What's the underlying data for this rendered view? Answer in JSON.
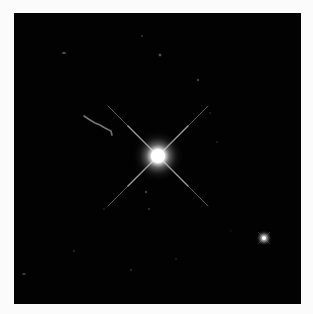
{
  "image": {
    "subject": "bright star with diffraction spikes and faint jet",
    "background_color": "#020202",
    "page_background": "#fbfbfb",
    "primary_star": {
      "x": 144,
      "y": 143,
      "radius": 10
    },
    "secondary_star": {
      "x": 250,
      "y": 225,
      "radius": 4
    },
    "jet": {
      "from": [
        70,
        103
      ],
      "to": [
        97,
        120
      ]
    },
    "faint_sources": [
      [
        50,
        40
      ],
      [
        128,
        23
      ],
      [
        146,
        42
      ],
      [
        184,
        67
      ],
      [
        196,
        100
      ],
      [
        132,
        179
      ],
      [
        135,
        196
      ],
      [
        203,
        129
      ],
      [
        10,
        261
      ],
      [
        117,
        257
      ],
      [
        162,
        246
      ],
      [
        60,
        238
      ],
      [
        90,
        196
      ],
      [
        217,
        218
      ]
    ]
  }
}
